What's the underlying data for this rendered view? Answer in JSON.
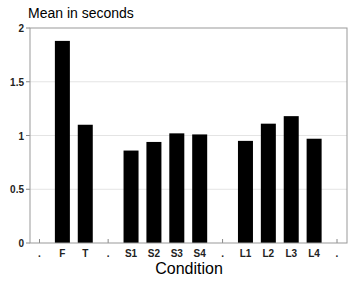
{
  "chart_data": {
    "type": "bar",
    "title": "Mean in seconds",
    "xlabel": "Condition",
    "ylabel": "",
    "ylim": [
      0,
      2
    ],
    "yticks": [
      0,
      0.5,
      1,
      1.5,
      2
    ],
    "ytick_labels": [
      "0",
      "0.5",
      "1",
      "1.5",
      "2"
    ],
    "xtick_labels": [
      ".",
      "F",
      "T",
      ".",
      "S1",
      "S2",
      "S3",
      "S4",
      ".",
      "L1",
      "L2",
      "L3",
      "L4",
      "."
    ],
    "categories": [
      "F",
      "T",
      "S1",
      "S2",
      "S3",
      "S4",
      "L1",
      "L2",
      "L3",
      "L4"
    ],
    "values": [
      1.88,
      1.1,
      0.86,
      0.94,
      1.02,
      1.01,
      0.95,
      1.11,
      1.18,
      0.97
    ],
    "grid": true,
    "bar_color": "#000000",
    "legend": null
  }
}
